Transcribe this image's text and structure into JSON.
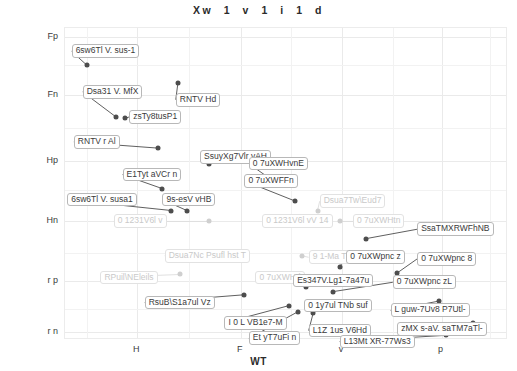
{
  "chart_data": {
    "type": "scatter",
    "title": "Xw  1  v  1  i  1  d",
    "xlabel": "WT",
    "ylabel": "7 H4",
    "grid": true,
    "legend": "none",
    "xlim": [
      0,
      100
    ],
    "ylim": [
      0,
      100
    ],
    "xticks": [
      {
        "label": "H",
        "pos": 16.3
      },
      {
        "label": "F",
        "pos": 39.7
      },
      {
        "label": "v",
        "pos": 62.5
      },
      {
        "label": "p",
        "pos": 85.0
      }
    ],
    "yticks": [
      {
        "label": "Fp",
        "pos": 97.0
      },
      {
        "label": "Fn",
        "pos": 78.5
      },
      {
        "label": "Hp",
        "pos": 57.5
      },
      {
        "label": "Hn",
        "pos": 38.0
      },
      {
        "label": "r p",
        "pos": 19.0
      },
      {
        "label": "r n",
        "pos": 2.5
      }
    ],
    "points": [
      {
        "label": "6sw6Tl V. sus-1",
        "x": 5.0,
        "y": 88.0,
        "faded": false,
        "lx": 1.5,
        "ly": 92.5
      },
      {
        "label": "Dsa31 V. MfX",
        "x": 11.5,
        "y": 71.5,
        "faded": false,
        "lx": 4.0,
        "ly": 79.5
      },
      {
        "label": "RNTV Hd",
        "x": 25.5,
        "y": 82.5,
        "faded": false,
        "lx": 25.0,
        "ly": 77.0
      },
      {
        "label": "zsTy8tusP1",
        "x": 13.5,
        "y": 71.0,
        "faded": false,
        "lx": 14.5,
        "ly": 71.5
      },
      {
        "label": "RNTV r Al",
        "x": 21.0,
        "y": 61.5,
        "faded": false,
        "lx": 2.0,
        "ly": 63.5
      },
      {
        "label": "SsuyXg7Vlr vAH",
        "x": 32.5,
        "y": 56.5,
        "faded": false,
        "lx": 30.5,
        "ly": 58.5
      },
      {
        "label": "0 7uXWHvnE",
        "x": 46.0,
        "y": 52.0,
        "faded": false,
        "lx": 41.5,
        "ly": 56.5
      },
      {
        "label": "E1Tyt aVCr n",
        "x": 22.0,
        "y": 48.5,
        "faded": false,
        "lx": 13.0,
        "ly": 53.0
      },
      {
        "label": "0 7uXWFFn",
        "x": 52.0,
        "y": 44.5,
        "faded": false,
        "lx": 40.5,
        "ly": 51.0
      },
      {
        "label": "6sw6Tl V. susa1",
        "x": 24.0,
        "y": 41.5,
        "faded": false,
        "lx": 0.5,
        "ly": 45.0
      },
      {
        "label": "9s-esV vHB",
        "x": 27.5,
        "y": 41.5,
        "faded": false,
        "lx": 22.0,
        "ly": 45.0
      },
      {
        "label": "Dsua7Tw\\Eud7",
        "x": 57.0,
        "y": 41.5,
        "faded": true,
        "lx": 57.5,
        "ly": 44.5
      },
      {
        "label": "0 1231V6l v",
        "x": 32.5,
        "y": 38.0,
        "faded": true,
        "lx": 11.0,
        "ly": 38.0
      },
      {
        "label": "0 1231V6l vV  14",
        "x": 47.0,
        "y": 38.0,
        "faded": true,
        "lx": 44.5,
        "ly": 38.0
      },
      {
        "label": "0 7uXWHtn",
        "x": 62.0,
        "y": 38.0,
        "faded": true,
        "lx": 65.0,
        "ly": 38.0
      },
      {
        "label": "SsaTMXRWFhNB",
        "x": 68.0,
        "y": 32.5,
        "faded": false,
        "lx": 79.5,
        "ly": 35.5
      },
      {
        "label": "Dsua7Nc Psufl hst T",
        "x": 31.5,
        "y": 27.5,
        "faded": true,
        "lx": 22.5,
        "ly": 27.0
      },
      {
        "label": "9 1-Ma T",
        "x": 53.5,
        "y": 27.0,
        "faded": true,
        "lx": 55.0,
        "ly": 26.5
      },
      {
        "label": "0 7uXWpnc z",
        "x": 62.0,
        "y": 23.5,
        "faded": false,
        "lx": 63.5,
        "ly": 26.5
      },
      {
        "label": "0 7uXWpnc 8",
        "x": 75.0,
        "y": 21.5,
        "faded": false,
        "lx": 79.5,
        "ly": 26.0
      },
      {
        "label": "RPuil\\NEleils",
        "x": 26.0,
        "y": 21.0,
        "faded": true,
        "lx": 8.0,
        "ly": 20.0
      },
      {
        "label": "0 7uXWHd",
        "x": 45.0,
        "y": 20.5,
        "faded": true,
        "lx": 43.0,
        "ly": 20.0
      },
      {
        "label": "Es347V.Lg1-7a47u",
        "x": 54.5,
        "y": 17.0,
        "faded": false,
        "lx": 51.5,
        "ly": 19.0
      },
      {
        "label": "0 7uXWpnc zL",
        "x": 60.5,
        "y": 15.5,
        "faded": false,
        "lx": 74.0,
        "ly": 18.5
      },
      {
        "label": "RsuB\\S1a7ul Vz",
        "x": 40.5,
        "y": 14.5,
        "faded": false,
        "lx": 18.0,
        "ly": 12.0
      },
      {
        "label": "0 1y7ul TNb suf",
        "x": 57.5,
        "y": 12.0,
        "faded": false,
        "lx": 54.0,
        "ly": 11.0
      },
      {
        "label": "L guw-7Uv8 P7Utl-",
        "x": 84.5,
        "y": 12.5,
        "faded": false,
        "lx": 73.5,
        "ly": 9.5
      },
      {
        "label": "I 0 L VB1e7-M",
        "x": 50.5,
        "y": 11.0,
        "faded": false,
        "lx": 36.0,
        "ly": 5.5
      },
      {
        "label": "L1Z 1us V6Hd",
        "x": 56.0,
        "y": 8.5,
        "faded": false,
        "lx": 55.0,
        "ly": 3.0
      },
      {
        "label": "Et yT7uFi n",
        "x": 52.5,
        "y": 9.0,
        "faded": false,
        "lx": 41.5,
        "ly": 0.5
      },
      {
        "label": "zMX s-aV. saTM7aTl-",
        "x": 92.0,
        "y": 5.5,
        "faded": false,
        "lx": 75.0,
        "ly": 3.5
      },
      {
        "label": "L13Mt XR-77Ws3",
        "x": 86.0,
        "y": 1.5,
        "faded": false,
        "lx": 62.0,
        "ly": -0.5
      }
    ]
  }
}
